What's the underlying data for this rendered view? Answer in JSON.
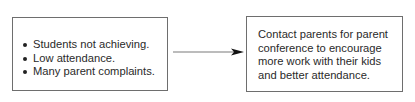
{
  "diagram": {
    "left_box": {
      "items": [
        "Students not achieving.",
        "Low attendance.",
        "Many parent complaints."
      ]
    },
    "right_box": {
      "text": "Contact parents for parent conference to encourage more work with their kids and better attendance."
    },
    "arrow": {
      "direction": "right",
      "color": "#7a7a7a",
      "head_color": "#111111"
    }
  }
}
